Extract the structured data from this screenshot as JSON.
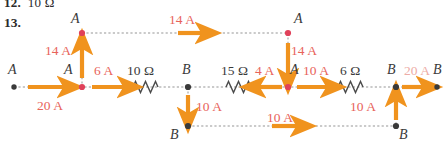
{
  "page": {
    "previous_item": {
      "number": "12.",
      "answer": "10 Ω"
    },
    "problem_number": "13."
  },
  "diagram": {
    "type": "electrical-circuit-current-diagram",
    "accent_color": "#f0931e",
    "current_text_color": "#e8635a",
    "node_dot_color_red": "#e0415a",
    "node_dot_color_dark": "#3a3a3a",
    "wire_color": "#b9b9b9",
    "nodes": [
      {
        "id": "n-left-end",
        "label": "A",
        "x": 14,
        "y": 87
      },
      {
        "id": "n-main-a1",
        "label": "A",
        "x": 82,
        "y": 87
      },
      {
        "id": "n-main-b1",
        "label": "B",
        "x": 188,
        "y": 87
      },
      {
        "id": "n-main-a2",
        "label": "A",
        "x": 288,
        "y": 87
      },
      {
        "id": "n-main-b2",
        "label": "B",
        "x": 396,
        "y": 87
      },
      {
        "id": "n-right-end",
        "label": "B",
        "x": 437,
        "y": 87
      },
      {
        "id": "n-top-left",
        "label": "A",
        "x": 82,
        "y": 33
      },
      {
        "id": "n-top-right",
        "label": "A",
        "x": 288,
        "y": 33
      },
      {
        "id": "n-bottom-left",
        "label": "B",
        "x": 188,
        "y": 126
      },
      {
        "id": "n-bottom-right",
        "label": "B",
        "x": 396,
        "y": 126
      }
    ],
    "resistors": [
      {
        "id": "r-10-ohm",
        "label": "10 Ω",
        "x": 145,
        "y": 87
      },
      {
        "id": "r-15-ohm",
        "label": "15 Ω",
        "x": 238,
        "y": 87
      },
      {
        "id": "r-6-ohm",
        "label": "6 Ω",
        "x": 350,
        "y": 87
      }
    ],
    "currents": [
      {
        "id": "i-20a-left",
        "label": "20 A",
        "value": 20,
        "unit": "A",
        "direction": "right",
        "segment": "left-end-to-A1"
      },
      {
        "id": "i-6a",
        "label": "6 A",
        "value": 6,
        "unit": "A",
        "direction": "right",
        "segment": "A1-to-10ohm"
      },
      {
        "id": "i-14a-up",
        "label": "14 A",
        "value": 14,
        "unit": "A",
        "direction": "up",
        "segment": "A1-to-top-left"
      },
      {
        "id": "i-14a-top",
        "label": "14 A",
        "value": 14,
        "unit": "A",
        "direction": "right",
        "segment": "top-rail"
      },
      {
        "id": "i-14a-down",
        "label": "14 A",
        "value": 14,
        "unit": "A",
        "direction": "down",
        "segment": "top-right-to-A2"
      },
      {
        "id": "i-4a",
        "label": "4 A",
        "value": 4,
        "unit": "A",
        "direction": "left",
        "segment": "A2-to-15ohm"
      },
      {
        "id": "i-10a-b1-down",
        "label": "10 A",
        "value": 10,
        "unit": "A",
        "direction": "down",
        "segment": "B1-to-bottom-left"
      },
      {
        "id": "i-10a-bottom",
        "label": "10 A",
        "value": 10,
        "unit": "A",
        "direction": "right",
        "segment": "bottom-rail"
      },
      {
        "id": "i-10a-right-up",
        "label": "10 A",
        "value": 10,
        "unit": "A",
        "direction": "up",
        "segment": "bottom-right-to-B2"
      },
      {
        "id": "i-10a-a2-right",
        "label": "10 A",
        "value": 10,
        "unit": "A",
        "direction": "right",
        "segment": "A2-to-6ohm"
      },
      {
        "id": "i-20a-right",
        "label": "20 A",
        "value": 20,
        "unit": "A",
        "direction": "right",
        "segment": "B2-to-right-end"
      }
    ]
  }
}
